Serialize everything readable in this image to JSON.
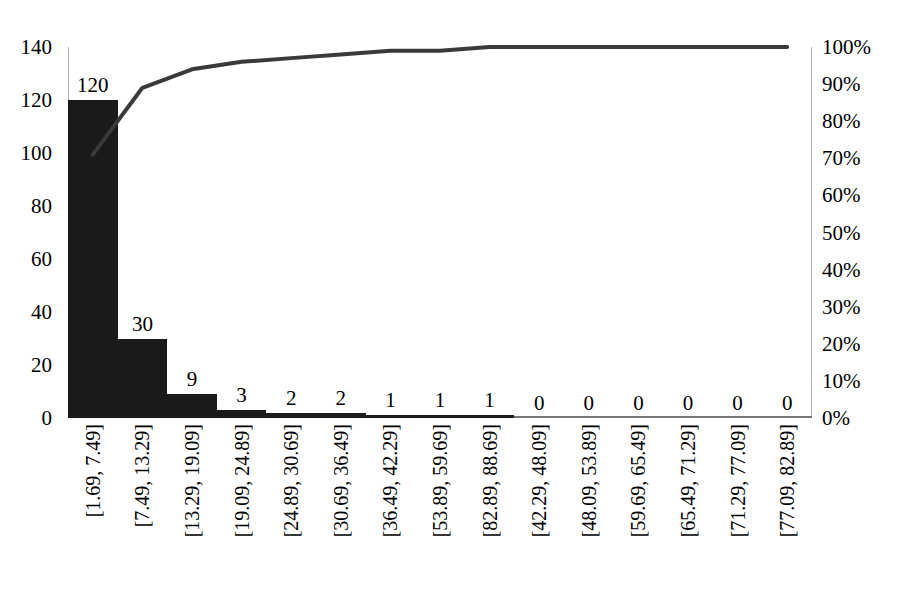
{
  "chart_data": {
    "type": "bar",
    "title": "",
    "subtitle": "",
    "xlabel": "",
    "ylabel": "",
    "categories": [
      "[1.69, 7.49]",
      "[7.49, 13.29]",
      "[13.29, 19.09]",
      "[19.09, 24.89]",
      "[24.89, 30.69]",
      "[30.69, 36.49]",
      "[36.49, 42.29]",
      "[53.89, 59.69]",
      "[82.89, 88.69]",
      "[42.29, 48.09]",
      "[48.09, 53.89]",
      "[59.69, 65.49]",
      "[65.49, 71.29]",
      "[71.29, 77.09]",
      "[77.09, 82.89]"
    ],
    "series": [
      {
        "name": "Frequency",
        "type": "bar",
        "axis": "left",
        "values": [
          120,
          30,
          9,
          3,
          2,
          2,
          1,
          1,
          1,
          0,
          0,
          0,
          0,
          0,
          0
        ],
        "labels": [
          "120",
          "30",
          "9",
          "3",
          "2",
          "2",
          "1",
          "1",
          "1",
          "0",
          "0",
          "0",
          "0",
          "0",
          "0"
        ],
        "color": "#1a1a1a"
      },
      {
        "name": "Cumulative %",
        "type": "line",
        "axis": "right",
        "values": [
          71,
          89,
          94,
          96,
          97,
          98,
          99,
          99,
          100,
          100,
          100,
          100,
          100,
          100,
          100
        ],
        "color": "#3a3a3a"
      }
    ],
    "ylim": [
      0,
      140
    ],
    "y_ticks": [
      0,
      20,
      40,
      60,
      80,
      100,
      120,
      140
    ],
    "y_tick_labels": [
      "0",
      "20",
      "40",
      "60",
      "80",
      "100",
      "120",
      "140"
    ],
    "y2lim": [
      0,
      100
    ],
    "y2_ticks": [
      0,
      10,
      20,
      30,
      40,
      50,
      60,
      70,
      80,
      90,
      100
    ],
    "y2_tick_labels": [
      "0%",
      "10%",
      "20%",
      "30%",
      "40%",
      "50%",
      "60%",
      "70%",
      "80%",
      "90%",
      "100%"
    ],
    "grid": false,
    "legend": "none",
    "axis_color": "#b0b0b0",
    "baseline_color": "#777777"
  }
}
